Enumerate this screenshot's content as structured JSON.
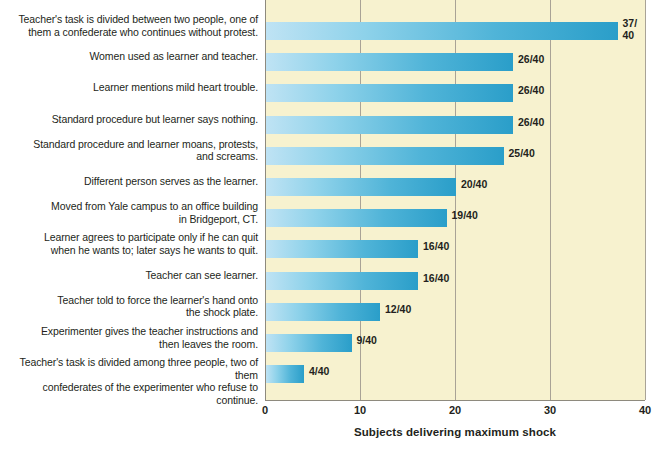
{
  "chart_data": {
    "type": "bar",
    "orientation": "horizontal",
    "title": "",
    "xlabel": "Subjects delivering maximum shock",
    "ylabel": "",
    "xlim": [
      0,
      40
    ],
    "xticks": [
      "0",
      "10",
      "20",
      "30",
      "40"
    ],
    "grid": true,
    "legend": "none",
    "denominator": 40,
    "categories": [
      "Teacher's task is divided between two people, one of them a confederate who continues without protest.",
      "Women used as learner and teacher.",
      "Learner mentions mild heart trouble.",
      "Standard procedure but learner says nothing.",
      "Standard procedure and learner moans, protests, and screams.",
      "Different person serves as the learner.",
      "Moved from Yale campus to an office building in Bridgeport, CT.",
      "Learner agrees to participate only if he can quit when he wants to; later says he wants to quit.",
      "Teacher can see learner.",
      "Teacher told to force the learner's hand onto the shock plate.",
      "Experimenter gives the teacher instructions and then leaves the room.",
      "Teacher's task is divided among three people, two of them confederates of the experimenter who refuse to continue."
    ],
    "values": [
      37,
      26,
      26,
      26,
      25,
      20,
      19,
      16,
      16,
      12,
      9,
      4
    ],
    "value_labels": [
      "37/\n40",
      "26/40",
      "26/40",
      "26/40",
      "25/40",
      "20/40",
      "19/40",
      "16/40",
      "16/40",
      "12/40",
      "9/40",
      "4/40"
    ]
  },
  "colors": {
    "plot_background": "#f7f2cf",
    "page_background": "#ffffff",
    "bar_light": "#bfe3f4",
    "bar_dark": "#2a9ec9",
    "gridline": "#a9a396",
    "text": "#231f20"
  },
  "rows": [
    {
      "label": "Teacher's task is divided between two people, one of\nthem a confederate who continues without protest.",
      "value": 37,
      "value_label": "37/\n40",
      "lines": 2
    },
    {
      "label": "Women used as learner and teacher.",
      "value": 26,
      "value_label": "26/40",
      "lines": 1
    },
    {
      "label": "Learner mentions mild heart trouble.",
      "value": 26,
      "value_label": "26/40",
      "lines": 1
    },
    {
      "label": "Standard procedure but learner says nothing.",
      "value": 26,
      "value_label": "26/40",
      "lines": 1
    },
    {
      "label": "Standard procedure and learner moans, protests,\nand screams.",
      "value": 25,
      "value_label": "25/40",
      "lines": 2
    },
    {
      "label": "Different person serves as the learner.",
      "value": 20,
      "value_label": "20/40",
      "lines": 1
    },
    {
      "label": "Moved from Yale campus to an office building\nin Bridgeport, CT.",
      "value": 19,
      "value_label": "19/40",
      "lines": 2
    },
    {
      "label": "Learner agrees to participate only if he can quit\nwhen he wants to; later says he wants to quit.",
      "value": 16,
      "value_label": "16/40",
      "lines": 2
    },
    {
      "label": "Teacher can see learner.",
      "value": 16,
      "value_label": "16/40",
      "lines": 1
    },
    {
      "label": "Teacher told to force the learner's hand onto\nthe shock plate.",
      "value": 12,
      "value_label": "12/40",
      "lines": 2
    },
    {
      "label": "Experimenter gives the teacher instructions and\nthen leaves the room.",
      "value": 9,
      "value_label": "9/40",
      "lines": 2
    },
    {
      "label": "Teacher's task is divided among three people, two of them\nconfederates of the experimenter who refuse to continue.",
      "value": 4,
      "value_label": "4/40",
      "lines": 2
    }
  ],
  "axis": {
    "title": "Subjects delivering maximum shock",
    "ticks": [
      "0",
      "10",
      "20",
      "30",
      "40"
    ]
  }
}
